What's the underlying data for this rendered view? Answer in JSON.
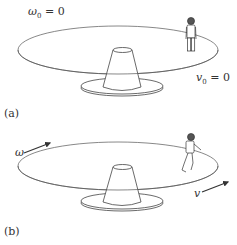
{
  "panels": [
    {
      "id": "a",
      "label": "(a)",
      "omega_label": "ω",
      "omega_sub": "0",
      "omega_eq": "= 0",
      "v_label": "v",
      "v_sub": "0",
      "v_eq": "= 0",
      "person_state": "standing"
    },
    {
      "id": "b",
      "label": "(b)",
      "omega_label": "ω",
      "v_label": "v",
      "person_state": "walking"
    }
  ],
  "colors": {
    "line": "#444444",
    "background": "#ffffff"
  }
}
